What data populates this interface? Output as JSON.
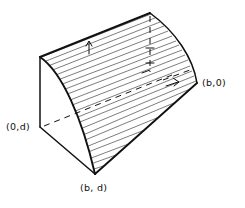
{
  "figure": {
    "type": "geometric-solid-diagram",
    "ink_color": "#111111",
    "background_color": "#ffffff",
    "labels": [
      {
        "id": "origin-depth",
        "name": "label-0d",
        "text": "(0,d)",
        "x": 6,
        "y": 122
      },
      {
        "id": "base-width",
        "name": "label-b0",
        "text": "(b,0)",
        "x": 202,
        "y": 78
      },
      {
        "id": "base-corner",
        "name": "label-bd",
        "text": "(b, d)",
        "x": 80,
        "y": 183
      }
    ],
    "vertices": {
      "top_left_ridge": [
        40,
        57
      ],
      "top_right_apex": [
        150,
        13
      ],
      "right_corner": [
        197,
        83
      ],
      "bottom_corner": [
        95,
        174
      ],
      "left_lower": [
        40,
        127
      ]
    },
    "hatching": {
      "line_count": 24,
      "direction": "parallel-to-top-ridge",
      "surface": "curved-ruled-surface"
    },
    "hidden_edges": {
      "style": "dashed",
      "count": 3
    },
    "arrow_markers": 4
  }
}
